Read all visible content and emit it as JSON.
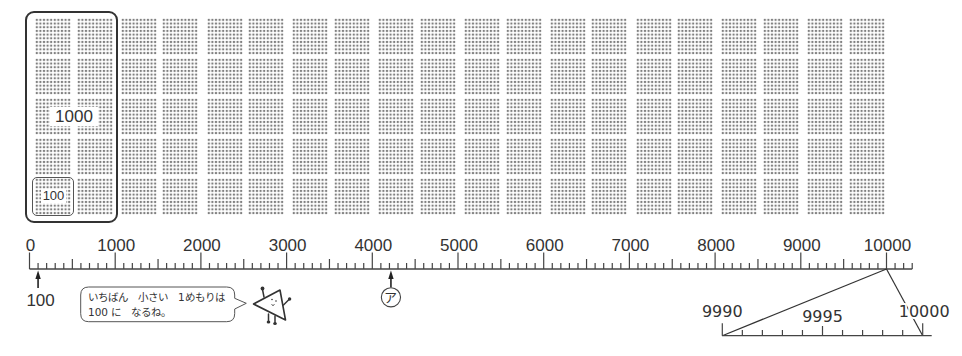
{
  "figure": {
    "dot_grid": {
      "groups": 10,
      "columns_per_group": 2,
      "rows_per_group": 5,
      "dots_per_block_side": 10,
      "thousand_label": "1000",
      "hundred_label": "100",
      "dot_color": "#7f7f7f"
    },
    "number_line": {
      "min": 0,
      "max": 10300,
      "minor_step": 100,
      "mid_step": 500,
      "major_step": 1000,
      "labels": [
        {
          "value": 0,
          "text": "0"
        },
        {
          "value": 1000,
          "text": "1000"
        },
        {
          "value": 2000,
          "text": "2000"
        },
        {
          "value": 3000,
          "text": "3000"
        },
        {
          "value": 4000,
          "text": "4000"
        },
        {
          "value": 5000,
          "text": "5000"
        },
        {
          "value": 6000,
          "text": "6000"
        },
        {
          "value": 7000,
          "text": "7000"
        },
        {
          "value": 8000,
          "text": "8000"
        },
        {
          "value": 9000,
          "text": "9000"
        },
        {
          "value": 10000,
          "text": "10000"
        }
      ],
      "markers": [
        {
          "name": "marker-100",
          "value": 100,
          "label": "100",
          "label_style": "plain"
        },
        {
          "name": "marker-a",
          "value": 4200,
          "label": "ア",
          "label_style": "circled"
        }
      ]
    },
    "zoom_line": {
      "source_value": 10000,
      "min": 9990,
      "max": 10000,
      "step": 1,
      "mid": 9995,
      "labels": [
        {
          "value": 9990,
          "text": "9990"
        },
        {
          "value": 9995,
          "text": "9995"
        },
        {
          "value": 10000,
          "text": "10000"
        }
      ]
    },
    "speech_bubble": {
      "lines": [
        "いちばん　小さい　1めもりは",
        "100 に　なるね。"
      ]
    },
    "character": "triangle-character",
    "line_color": "#444444",
    "text_color": "#333333"
  }
}
